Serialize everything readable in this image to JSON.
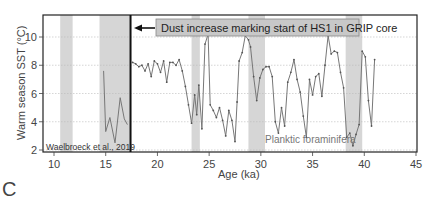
{
  "chart_data": {
    "type": "line",
    "title": "",
    "panel_label": "C",
    "xlabel": "Age (ka)",
    "ylabel": "Warm season SST (°C)",
    "xlim": [
      9,
      45
    ],
    "ylim": [
      1.2,
      11.2
    ],
    "x_ticks": [
      10,
      15,
      20,
      25,
      30,
      35,
      40,
      45
    ],
    "y_ticks": [
      2,
      4,
      6,
      8,
      10
    ],
    "grid": "horizontal dotted at y ticks",
    "shaded_bands_ka": [
      [
        10.6,
        11.8
      ],
      [
        14.4,
        17.4
      ],
      [
        23.3,
        24.1
      ],
      [
        28.8,
        30.4
      ],
      [
        38.2,
        39.8
      ]
    ],
    "vertical_line_ka": 17.4,
    "annotation": "Dust increase marking start of HS1 in GRIP core",
    "series": [
      {
        "name": "Waelbroeck et al., 2019",
        "x": [
          14.8,
          15.0,
          15.4,
          15.9,
          16.4,
          16.8,
          17.1
        ],
        "y": [
          7.6,
          3.3,
          4.3,
          2.5,
          5.7,
          4.2,
          3.8
        ]
      },
      {
        "name": "Planktic foraminifera",
        "x": [
          17.6,
          17.9,
          18.2,
          18.5,
          18.8,
          19.1,
          19.4,
          19.7,
          20.0,
          20.3,
          20.6,
          20.9,
          21.2,
          21.5,
          21.8,
          22.1,
          22.4,
          22.7,
          23.0,
          23.3,
          23.6,
          23.8,
          24.0,
          24.3,
          24.6,
          24.9,
          25.1,
          25.4,
          25.7,
          26.0,
          26.3,
          26.6,
          26.9,
          27.2,
          27.5,
          27.7,
          27.9,
          28.2,
          28.5,
          28.8,
          29.0,
          29.3,
          29.6,
          29.9,
          30.2,
          30.5,
          30.8,
          31.1,
          31.4,
          31.7,
          32.0,
          32.3,
          32.6,
          32.9,
          33.2,
          33.5,
          33.8,
          34.1,
          34.4,
          34.7,
          35.0,
          35.3,
          35.6,
          35.9,
          36.2,
          36.5,
          36.8,
          37.1,
          37.4,
          37.7,
          38.0,
          38.3,
          38.6,
          38.9,
          39.2,
          39.5,
          39.8,
          40.1,
          40.4,
          40.7,
          41.0
        ],
        "y": [
          8.2,
          8.1,
          7.9,
          8.0,
          7.6,
          8.1,
          7.2,
          8.3,
          8.1,
          7.5,
          8.3,
          6.8,
          8.2,
          8.2,
          8.0,
          8.4,
          7.6,
          6.5,
          5.2,
          3.9,
          5.9,
          4.5,
          6.6,
          3.5,
          9.5,
          10.2,
          5.2,
          4.8,
          4.3,
          5.0,
          4.1,
          3.0,
          4.8,
          4.1,
          2.6,
          5.4,
          8.3,
          8.9,
          10.1,
          9.8,
          9.3,
          7.2,
          5.5,
          7.1,
          7.7,
          7.9,
          7.9,
          7.2,
          4.0,
          3.2,
          5.0,
          3.7,
          6.8,
          7.5,
          8.4,
          7.0,
          6.1,
          4.4,
          2.9,
          7.0,
          5.9,
          7.2,
          7.4,
          5.8,
          8.0,
          10.1,
          8.8,
          9.0,
          8.9,
          7.5,
          6.4,
          2.9,
          3.2,
          2.3,
          3.1,
          3.8,
          9.0,
          8.6,
          5.5,
          3.7,
          8.4
        ]
      }
    ]
  },
  "labels": {
    "panel": "C",
    "xlabel": "Age (ka)",
    "ylabel": "Warm season SST (°C)",
    "annotation": "Dust increase marking start of HS1 in GRIP core",
    "left_series_label": "Waelbroeck et al., 2019",
    "right_series_label": "Planktic foraminifera"
  },
  "colors": {
    "axis": "#222222",
    "band": "#d6d6d6",
    "grid": "#bbbbbb",
    "line": "#777777",
    "annotation_box": "#c8c8c8",
    "text": "#444444"
  }
}
